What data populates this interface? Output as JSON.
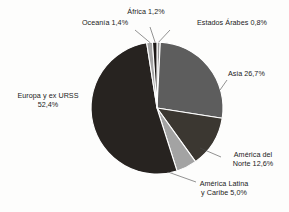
{
  "chart_data": {
    "type": "pie",
    "title": "",
    "subtitle": "",
    "xlabel": "",
    "ylabel": "",
    "legend_position": "none",
    "grid": false,
    "value_suffix": "%",
    "decimal_separator": ",",
    "categories": [
      "Estados Árabes",
      "Asia",
      "América del Norte",
      "América Latina y Caribe",
      "Europa y ex URSS",
      "Oceanía",
      "África"
    ],
    "values": [
      0.8,
      26.7,
      12.6,
      5.0,
      52.4,
      1.4,
      1.2
    ],
    "slices": [
      {
        "name": "Estados Árabes",
        "value": 0.8,
        "value_text": "0,8%",
        "label_text": "Estados Árabes 0,8%",
        "color": "#9a9a9a",
        "start_deg": 0.0,
        "end_deg": 2.88
      },
      {
        "name": "Asia",
        "value": 26.7,
        "value_text": "26,7%",
        "label_text": "Asia 26,7%",
        "color": "#5d5d5d",
        "start_deg": 2.88,
        "end_deg": 99.0
      },
      {
        "name": "América del Norte",
        "value": 12.6,
        "value_text": "12,6%",
        "label_line_1": "América del",
        "label_line_2": "Norte 12,6%",
        "color": "#3b3731",
        "start_deg": 99.0,
        "end_deg": 144.36
      },
      {
        "name": "América Latina y Caribe",
        "value": 5.0,
        "value_text": "5,0%",
        "label_line_1": "América Latina",
        "label_line_2": "y Caribe 5,0%",
        "color": "#a3a3a3",
        "start_deg": 144.36,
        "end_deg": 162.36
      },
      {
        "name": "Europa y ex URSS",
        "value": 52.4,
        "value_text": "52,4%",
        "label_line_1": "Europa y ex URSS",
        "label_line_2": "52,4%",
        "color": "#272320",
        "start_deg": 162.36,
        "end_deg": 351.0
      },
      {
        "name": "Oceanía",
        "value": 1.4,
        "value_text": "1,4%",
        "label_text": "Oceanía 1,4%",
        "color": "#a5a5a5",
        "start_deg": 351.0,
        "end_deg": 356.04
      },
      {
        "name": "África",
        "value": 1.2,
        "value_text": "1,2%",
        "label_text": "África 1,2%",
        "color": "#1d1a18",
        "start_deg": 356.04,
        "end_deg": 360.0
      }
    ],
    "geometry": {
      "center_x": 157,
      "center_y": 108,
      "radius": 66
    },
    "leader_lines": [
      {
        "name": "africa-leader",
        "x1": 155.2,
        "y1": 42.5,
        "x2": 150.0,
        "y2": 27.0
      },
      {
        "name": "arabes-leader",
        "x1": 158.7,
        "y1": 42.1,
        "x2": 170.0,
        "y2": 30.0
      },
      {
        "name": "oceania-leader",
        "x1": 150.5,
        "y1": 43.0,
        "x2": 135.0,
        "y2": 30.0
      },
      {
        "name": "asia-leader",
        "x1": 220.0,
        "y1": 90.0,
        "x2": 227.0,
        "y2": 80.0
      },
      {
        "name": "norte-leader",
        "x1": 200.0,
        "y1": 148.0,
        "x2": 221.0,
        "y2": 157.0
      },
      {
        "name": "latina-leader",
        "x1": 168.0,
        "y1": 172.0,
        "x2": 196.0,
        "y2": 182.0
      }
    ]
  },
  "labels": {
    "africa": "África 1,2%",
    "oceania": "Oceanía 1,4%",
    "arabes": "Estados Árabes 0,8%",
    "asia": "Asia 26,7%",
    "europa_line1": "Europa y ex URSS",
    "europa_line2": "52,4%",
    "norte_line1": "América del",
    "norte_line2": "Norte 12,6%",
    "latina_line1": "América Latina",
    "latina_line2": "y Caribe 5,0%"
  }
}
